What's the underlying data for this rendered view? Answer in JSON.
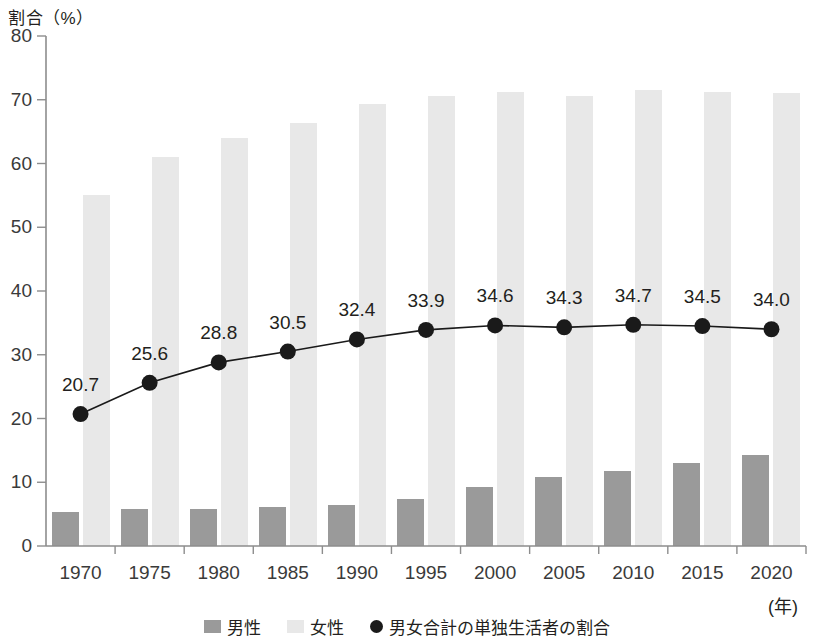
{
  "chart_data": {
    "type": "bar",
    "title": "",
    "ylabel": "割合（%）",
    "xlabel": "(年)",
    "categories": [
      "1970",
      "1975",
      "1980",
      "1985",
      "1990",
      "1995",
      "2000",
      "2005",
      "2010",
      "2015",
      "2020"
    ],
    "ylim": [
      0,
      80
    ],
    "yticks": [
      0,
      10,
      20,
      30,
      40,
      50,
      60,
      70,
      80
    ],
    "grid": false,
    "legend_position": "bottom",
    "series": [
      {
        "name": "男性",
        "kind": "bar",
        "color": "#9a9a9a",
        "values": [
          5.3,
          5.8,
          5.8,
          6.1,
          6.5,
          7.3,
          9.2,
          10.9,
          11.8,
          13.0,
          14.2
        ]
      },
      {
        "name": "女性",
        "kind": "bar",
        "color": "#e8e8e8",
        "values": [
          55.0,
          61.0,
          64.0,
          66.3,
          69.3,
          70.6,
          71.2,
          70.6,
          71.6,
          71.2,
          71.0
        ]
      },
      {
        "name": "男女合計の単独生活者の割合",
        "kind": "line",
        "color": "#1a1a1a",
        "values": [
          20.7,
          25.6,
          28.8,
          30.5,
          32.4,
          33.9,
          34.6,
          34.3,
          34.7,
          34.5,
          34.0
        ],
        "data_labels": [
          "20.7",
          "25.6",
          "28.8",
          "30.5",
          "32.4",
          "33.9",
          "34.6",
          "34.3",
          "34.7",
          "34.5",
          "34.0"
        ]
      }
    ]
  },
  "legend": {
    "items": [
      {
        "label": "男性",
        "marker": "square",
        "color": "#9a9a9a"
      },
      {
        "label": "女性",
        "marker": "square",
        "color": "#e8e8e8"
      },
      {
        "label": "男女合計の単独生活者の割合",
        "marker": "circle",
        "color": "#1a1a1a"
      }
    ]
  },
  "axis": {
    "y_axis_title": "割合（%）",
    "x_axis_unit": "(年)"
  }
}
